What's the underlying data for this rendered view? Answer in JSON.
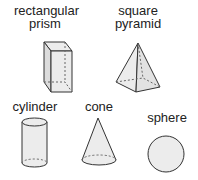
{
  "shapes": [
    {
      "id": "rectangular-prism",
      "label_line1": "rectangular",
      "label_line2": "prism"
    },
    {
      "id": "square-pyramid",
      "label_line1": "square",
      "label_line2": "pyramid"
    },
    {
      "id": "cylinder",
      "label_line1": "cylinder"
    },
    {
      "id": "cone",
      "label_line1": "cone"
    },
    {
      "id": "sphere",
      "label_line1": "sphere"
    }
  ],
  "colors": {
    "fill": "#ececec",
    "stroke": "#333333"
  }
}
